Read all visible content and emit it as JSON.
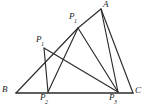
{
  "figure": {
    "width": 150,
    "height": 112,
    "background_color": "#ffffff",
    "line_color": "#2b2b2b",
    "label_color": "#1c1c1c",
    "points": [
      {
        "id": "A",
        "label": "A",
        "sub": "",
        "x": 101,
        "y": 9,
        "label_x": 103,
        "label_y": 1
      },
      {
        "id": "B",
        "label": "B",
        "sub": "",
        "x": 16,
        "y": 93,
        "label_x": 3,
        "label_y": 86
      },
      {
        "id": "C",
        "label": "C",
        "sub": "",
        "x": 133,
        "y": 93,
        "label_x": 135,
        "label_y": 88
      },
      {
        "id": "P1",
        "label": "P",
        "sub": "1",
        "x": 78,
        "y": 28,
        "label_x": 70,
        "label_y": 13
      },
      {
        "id": "P2",
        "label": "P",
        "sub": "2",
        "x": 48,
        "y": 92,
        "label_x": 41,
        "label_y": 94
      },
      {
        "id": "P3",
        "label": "P",
        "sub": "3",
        "x": 118,
        "y": 92,
        "label_x": 110,
        "label_y": 94
      },
      {
        "id": "R",
        "label": "P",
        "sub": "1",
        "x": 44,
        "y": 48,
        "label_x": 37,
        "label_y": 36
      }
    ],
    "segments": [
      {
        "name": "base-bc",
        "from": "B",
        "to": "C",
        "weight": "base"
      },
      {
        "name": "side-ac",
        "from": "A",
        "to": "C",
        "weight": "normal"
      },
      {
        "name": "b-to-p1top",
        "from": "B",
        "to": "P1",
        "weight": "normal"
      },
      {
        "name": "a-to-p3",
        "from": "A",
        "to": "P3",
        "weight": "normal"
      },
      {
        "name": "p1-to-p2",
        "from": "P1",
        "to": "P2",
        "weight": "normal"
      },
      {
        "name": "p1-to-p3",
        "from": "P1",
        "to": "P3",
        "weight": "normal"
      },
      {
        "name": "r-to-p2",
        "from": "R",
        "to": "P2",
        "weight": "normal"
      },
      {
        "name": "r-to-p3",
        "from": "R",
        "to": "P3",
        "weight": "normal"
      }
    ]
  }
}
